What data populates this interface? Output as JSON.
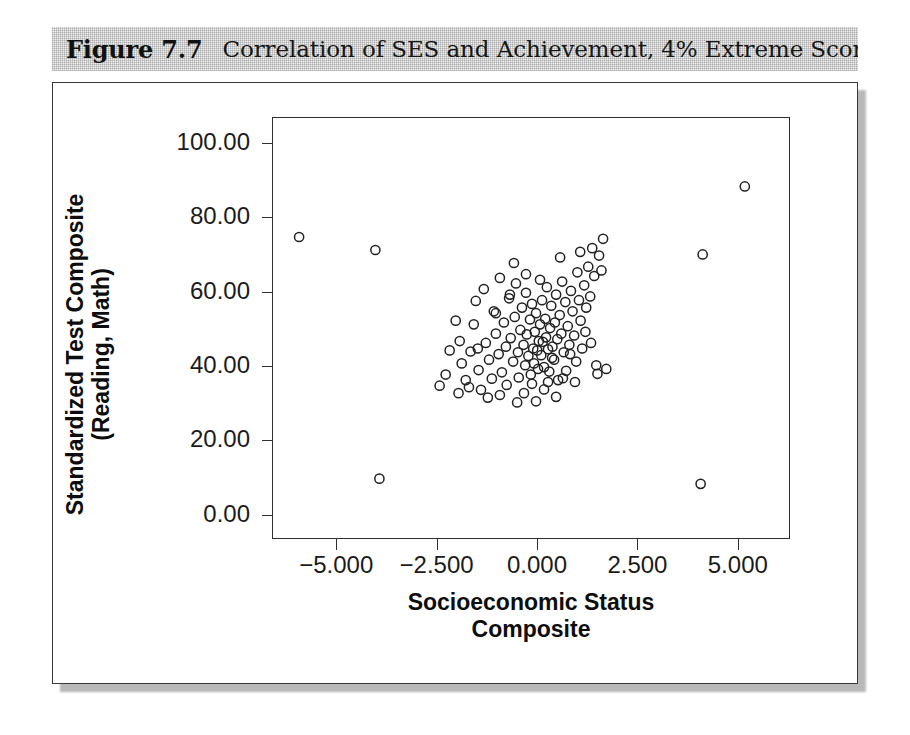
{
  "figure": {
    "number_label": "Figure 7.7",
    "caption": "Correlation of SES and Achievement, 4% Extreme Scores"
  },
  "chart_data": {
    "type": "scatter",
    "title": "Correlation of SES and Achievement, 4% Extreme Scores",
    "xlabel": "Socioeconomic Status Composite",
    "xlabel_lines": [
      "Socioeconomic Status",
      "Composite"
    ],
    "ylabel": "Standardized Test Composite (Reading, Math)",
    "ylabel_lines": [
      "Standardized Test Composite",
      "(Reading, Math)"
    ],
    "xlim": [
      -6.6,
      6.3
    ],
    "ylim": [
      -6.5,
      107.0
    ],
    "xticks": [
      -5.0,
      -2.5,
      0.0,
      2.5,
      5.0
    ],
    "xtick_labels": [
      "-5.000",
      "-2.500",
      "0.000",
      "2.500",
      "5.000"
    ],
    "yticks": [
      0,
      20,
      40,
      60,
      80,
      100
    ],
    "ytick_labels": [
      "0.00",
      "20.00",
      "40.00",
      "60.00",
      "80.00",
      "100.00"
    ],
    "grid": false,
    "legend": null,
    "marker": {
      "shape": "open-circle",
      "radius_px": 4.6,
      "edge_color": "#222222",
      "fill_color": "none",
      "line_width_px": 1.5
    },
    "points": [
      [
        -5.95,
        75.0
      ],
      [
        -4.05,
        71.5
      ],
      [
        -3.95,
        10.0
      ],
      [
        4.1,
        70.3
      ],
      [
        4.05,
        8.6
      ],
      [
        5.15,
        88.6
      ],
      [
        -1.95,
        47.0
      ],
      [
        -1.9,
        41.0
      ],
      [
        -1.8,
        36.5
      ],
      [
        -1.72,
        34.6
      ],
      [
        -1.68,
        44.2
      ],
      [
        -1.6,
        51.5
      ],
      [
        -1.55,
        57.8
      ],
      [
        -1.48,
        39.2
      ],
      [
        -1.42,
        33.9
      ],
      [
        -1.35,
        61.0
      ],
      [
        -1.3,
        46.5
      ],
      [
        -1.22,
        42.0
      ],
      [
        -1.15,
        36.9
      ],
      [
        -1.1,
        55.0
      ],
      [
        -1.05,
        49.0
      ],
      [
        -0.98,
        43.5
      ],
      [
        -0.95,
        64.0
      ],
      [
        -0.9,
        38.6
      ],
      [
        -0.85,
        52.0
      ],
      [
        -0.8,
        45.5
      ],
      [
        -0.78,
        35.2
      ],
      [
        -0.72,
        58.5
      ],
      [
        -0.68,
        47.8
      ],
      [
        -0.62,
        41.5
      ],
      [
        -0.58,
        53.5
      ],
      [
        -0.55,
        62.5
      ],
      [
        -0.5,
        44.0
      ],
      [
        -0.48,
        37.2
      ],
      [
        -0.44,
        50.0
      ],
      [
        -0.4,
        56.0
      ],
      [
        -0.36,
        46.0
      ],
      [
        -0.32,
        40.5
      ],
      [
        -0.3,
        60.0
      ],
      [
        -0.28,
        48.8
      ],
      [
        -0.24,
        43.0
      ],
      [
        -0.2,
        52.8
      ],
      [
        -0.18,
        38.0
      ],
      [
        -0.15,
        57.0
      ],
      [
        -0.12,
        45.0
      ],
      [
        -0.1,
        41.0
      ],
      [
        -0.08,
        49.5
      ],
      [
        -0.05,
        54.5
      ],
      [
        -0.02,
        44.5
      ],
      [
        0.0,
        39.5
      ],
      [
        0.02,
        47.0
      ],
      [
        0.05,
        51.5
      ],
      [
        0.08,
        43.2
      ],
      [
        0.1,
        58.0
      ],
      [
        0.12,
        46.8
      ],
      [
        0.15,
        40.0
      ],
      [
        0.18,
        53.0
      ],
      [
        0.2,
        48.0
      ],
      [
        0.22,
        61.5
      ],
      [
        0.25,
        44.8
      ],
      [
        0.28,
        38.8
      ],
      [
        0.3,
        50.5
      ],
      [
        0.33,
        56.5
      ],
      [
        0.36,
        45.5
      ],
      [
        0.4,
        42.0
      ],
      [
        0.42,
        52.0
      ],
      [
        0.45,
        59.5
      ],
      [
        0.48,
        47.5
      ],
      [
        0.5,
        36.5
      ],
      [
        0.54,
        54.0
      ],
      [
        0.58,
        49.0
      ],
      [
        0.6,
        63.0
      ],
      [
        0.64,
        44.0
      ],
      [
        0.68,
        57.5
      ],
      [
        0.7,
        39.0
      ],
      [
        0.74,
        51.0
      ],
      [
        0.78,
        46.0
      ],
      [
        0.82,
        60.5
      ],
      [
        0.86,
        55.0
      ],
      [
        0.9,
        48.5
      ],
      [
        0.95,
        41.5
      ],
      [
        0.98,
        65.5
      ],
      [
        1.02,
        58.0
      ],
      [
        1.06,
        52.5
      ],
      [
        1.1,
        45.0
      ],
      [
        1.15,
        62.0
      ],
      [
        1.2,
        56.0
      ],
      [
        1.25,
        67.0
      ],
      [
        1.3,
        59.0
      ],
      [
        1.35,
        72.0
      ],
      [
        1.4,
        64.5
      ],
      [
        1.45,
        40.5
      ],
      [
        1.48,
        38.2
      ],
      [
        1.52,
        70.0
      ],
      [
        1.58,
        66.0
      ],
      [
        1.62,
        74.5
      ],
      [
        1.7,
        39.5
      ],
      [
        -0.6,
        68.0
      ],
      [
        -0.3,
        65.0
      ],
      [
        0.55,
        69.5
      ],
      [
        1.05,
        71.0
      ],
      [
        -2.05,
        52.5
      ],
      [
        -2.3,
        38.0
      ],
      [
        -2.45,
        35.0
      ],
      [
        -1.98,
        33.0
      ],
      [
        -1.25,
        31.8
      ],
      [
        -0.95,
        32.5
      ],
      [
        -0.35,
        33.0
      ],
      [
        0.15,
        34.0
      ],
      [
        0.45,
        32.0
      ],
      [
        -0.05,
        30.8
      ],
      [
        0.25,
        36.0
      ],
      [
        -0.15,
        35.5
      ],
      [
        0.35,
        42.5
      ],
      [
        -0.7,
        59.5
      ],
      [
        0.05,
        63.5
      ],
      [
        0.8,
        43.5
      ],
      [
        1.18,
        49.5
      ],
      [
        1.32,
        46.5
      ],
      [
        -1.05,
        54.5
      ],
      [
        -1.5,
        45.0
      ],
      [
        -2.2,
        44.5
      ],
      [
        -0.52,
        30.5
      ],
      [
        0.62,
        37.0
      ],
      [
        0.92,
        36.0
      ]
    ]
  }
}
